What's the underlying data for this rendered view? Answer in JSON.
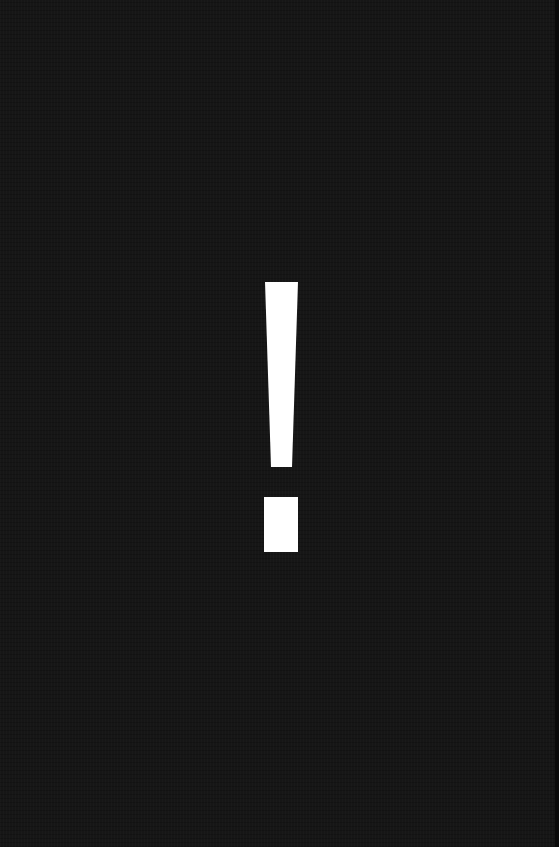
{
  "symbol": {
    "glyph": "!",
    "meaning": "exclamation-mark",
    "color": "#ffffff"
  },
  "background": {
    "color": "#161616"
  }
}
